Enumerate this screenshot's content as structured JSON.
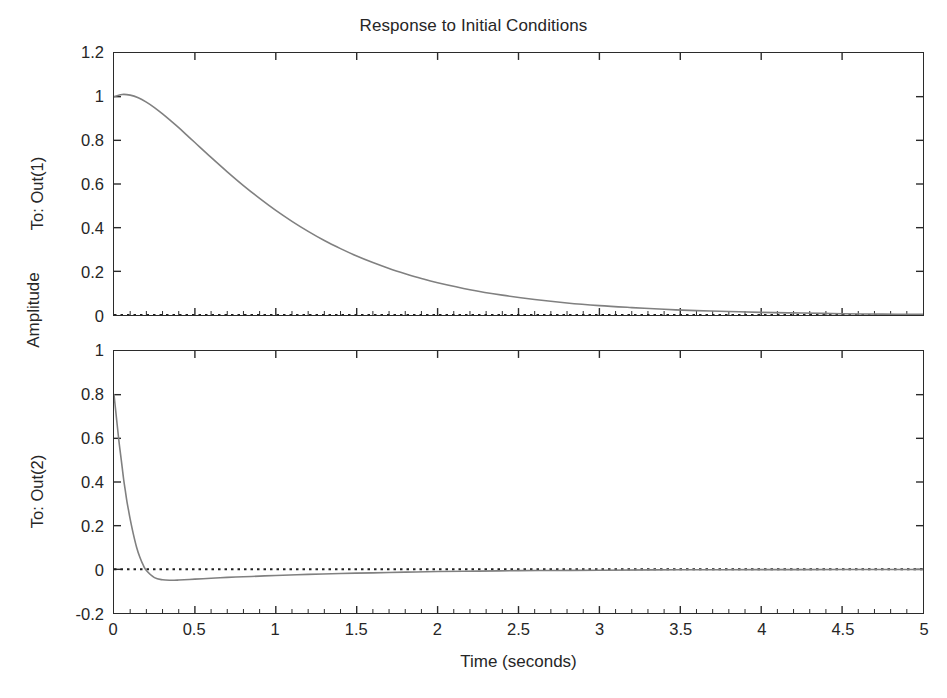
{
  "figure": {
    "title": "Response to Initial Conditions",
    "global_ylabel": "Amplitude",
    "xlabel": "Time (seconds)",
    "background_color": "#ffffff",
    "line_color": "#808080",
    "axis_color": "#2b2b2b",
    "zero_line_style": "dotted"
  },
  "chart_data": [
    {
      "type": "line",
      "title": "Response to Initial Conditions",
      "subplot_index": 1,
      "ylabel": "To: Out(1)",
      "xlabel": "",
      "xlim": [
        0,
        5
      ],
      "ylim": [
        0,
        1.2
      ],
      "xticks": [
        "0",
        "0.5",
        "1",
        "1.5",
        "2",
        "2.5",
        "3",
        "3.5",
        "4",
        "4.5",
        "5"
      ],
      "xtick_values": [
        0,
        0.5,
        1,
        1.5,
        2,
        2.5,
        3,
        3.5,
        4,
        4.5,
        5
      ],
      "yticks": [
        "0",
        "0.2",
        "0.4",
        "0.6",
        "0.8",
        "1",
        "1.2"
      ],
      "ytick_values": [
        0,
        0.2,
        0.4,
        0.6,
        0.8,
        1,
        1.2
      ],
      "grid": false,
      "legend": null,
      "zero_reference_line": 0,
      "series": [
        {
          "name": "To: Out(1)",
          "color": "#808080",
          "x": [
            0,
            0.05,
            0.1,
            0.15,
            0.2,
            0.25,
            0.3,
            0.35,
            0.4,
            0.45,
            0.5,
            0.6,
            0.7,
            0.8,
            0.9,
            1.0,
            1.1,
            1.2,
            1.3,
            1.4,
            1.5,
            1.6,
            1.7,
            1.8,
            1.9,
            2.0,
            2.2,
            2.4,
            2.6,
            2.8,
            3.0,
            3.2,
            3.4,
            3.6,
            3.8,
            4.0,
            4.25,
            4.5,
            4.75,
            5.0
          ],
          "y": [
            1.0,
            1.01,
            1.007,
            0.995,
            0.975,
            0.95,
            0.921,
            0.89,
            0.858,
            0.824,
            0.79,
            0.722,
            0.656,
            0.593,
            0.534,
            0.479,
            0.429,
            0.383,
            0.341,
            0.304,
            0.27,
            0.24,
            0.213,
            0.189,
            0.167,
            0.148,
            0.116,
            0.091,
            0.071,
            0.055,
            0.043,
            0.034,
            0.026,
            0.02,
            0.016,
            0.012,
            0.009,
            0.006,
            0.004,
            0.003
          ]
        }
      ]
    },
    {
      "type": "line",
      "subplot_index": 2,
      "ylabel": "To: Out(2)",
      "xlabel": "Time (seconds)",
      "xlim": [
        0,
        5
      ],
      "ylim": [
        -0.2,
        1.0
      ],
      "xticks": [
        "0",
        "0.5",
        "1",
        "1.5",
        "2",
        "2.5",
        "3",
        "3.5",
        "4",
        "4.5",
        "5"
      ],
      "xtick_values": [
        0,
        0.5,
        1,
        1.5,
        2,
        2.5,
        3,
        3.5,
        4,
        4.5,
        5
      ],
      "yticks": [
        "-0.2",
        "0",
        "0.2",
        "0.4",
        "0.6",
        "0.8",
        "1"
      ],
      "ytick_values": [
        -0.2,
        0,
        0.2,
        0.4,
        0.6,
        0.8,
        1
      ],
      "grid": false,
      "legend": null,
      "zero_reference_line": 0,
      "series": [
        {
          "name": "To: Out(2)",
          "color": "#808080",
          "x": [
            0,
            0.01,
            0.02,
            0.03,
            0.04,
            0.05,
            0.06,
            0.07,
            0.08,
            0.09,
            0.1,
            0.12,
            0.14,
            0.16,
            0.18,
            0.2,
            0.25,
            0.3,
            0.35,
            0.4,
            0.5,
            0.6,
            0.7,
            0.8,
            0.9,
            1.0,
            1.2,
            1.4,
            1.6,
            1.8,
            2.0,
            2.25,
            2.5,
            2.75,
            3.0,
            3.5,
            4.0,
            4.5,
            5.0
          ],
          "y": [
            0.8,
            0.73,
            0.66,
            0.59,
            0.53,
            0.47,
            0.41,
            0.36,
            0.31,
            0.27,
            0.23,
            0.16,
            0.1,
            0.055,
            0.02,
            -0.005,
            -0.038,
            -0.048,
            -0.05,
            -0.049,
            -0.045,
            -0.041,
            -0.037,
            -0.034,
            -0.031,
            -0.028,
            -0.023,
            -0.019,
            -0.016,
            -0.013,
            -0.01,
            -0.008,
            -0.006,
            -0.005,
            -0.004,
            -0.002,
            -0.0015,
            -0.001,
            -0.0008
          ]
        }
      ]
    }
  ],
  "subplots": [
    {
      "ylabel": "To: Out(1)"
    },
    {
      "ylabel": "To: Out(2)"
    }
  ]
}
